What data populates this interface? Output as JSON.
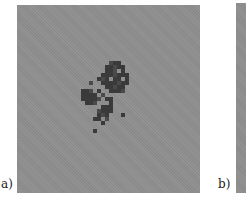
{
  "figure": {
    "panels": [
      {
        "id": "a",
        "label": "a)",
        "background": "#8f8f8f",
        "cluster_color": "#3a3a3a"
      },
      {
        "id": "b",
        "label": "b)",
        "background": "#8f8f8f"
      }
    ]
  },
  "cluster_cells": [
    [
      92,
      56
    ],
    [
      96,
      56
    ],
    [
      100,
      56
    ],
    [
      88,
      60
    ],
    [
      92,
      60
    ],
    [
      96,
      60
    ],
    [
      100,
      60
    ],
    [
      104,
      60
    ],
    [
      88,
      64
    ],
    [
      92,
      64
    ],
    [
      96,
      64
    ],
    [
      104,
      64
    ],
    [
      84,
      68
    ],
    [
      88,
      68
    ],
    [
      92,
      68
    ],
    [
      96,
      68
    ],
    [
      100,
      68
    ],
    [
      104,
      68
    ],
    [
      108,
      68
    ],
    [
      80,
      72
    ],
    [
      84,
      72
    ],
    [
      88,
      72
    ],
    [
      96,
      72
    ],
    [
      100,
      72
    ],
    [
      108,
      72
    ],
    [
      72,
      76
    ],
    [
      84,
      76
    ],
    [
      88,
      76
    ],
    [
      92,
      76
    ],
    [
      96,
      76
    ],
    [
      100,
      76
    ],
    [
      104,
      76
    ],
    [
      108,
      76
    ],
    [
      88,
      80
    ],
    [
      92,
      80
    ],
    [
      96,
      80
    ],
    [
      100,
      80
    ],
    [
      104,
      80
    ],
    [
      64,
      84
    ],
    [
      68,
      84
    ],
    [
      72,
      84
    ],
    [
      80,
      84
    ],
    [
      92,
      84
    ],
    [
      96,
      84
    ],
    [
      100,
      84
    ],
    [
      104,
      84
    ],
    [
      64,
      88
    ],
    [
      68,
      88
    ],
    [
      72,
      88
    ],
    [
      76,
      88
    ],
    [
      84,
      88
    ],
    [
      64,
      92
    ],
    [
      68,
      92
    ],
    [
      72,
      92
    ],
    [
      76,
      92
    ],
    [
      80,
      92
    ],
    [
      88,
      92
    ],
    [
      92,
      92
    ],
    [
      68,
      96
    ],
    [
      72,
      96
    ],
    [
      76,
      96
    ],
    [
      92,
      96
    ],
    [
      84,
      100
    ],
    [
      88,
      100
    ],
    [
      92,
      100
    ],
    [
      80,
      104
    ],
    [
      84,
      104
    ],
    [
      88,
      104
    ],
    [
      92,
      104
    ],
    [
      80,
      108
    ],
    [
      84,
      108
    ],
    [
      88,
      108
    ],
    [
      104,
      108
    ],
    [
      76,
      112
    ],
    [
      80,
      112
    ],
    [
      88,
      112
    ],
    [
      84,
      116
    ],
    [
      76,
      124
    ]
  ]
}
